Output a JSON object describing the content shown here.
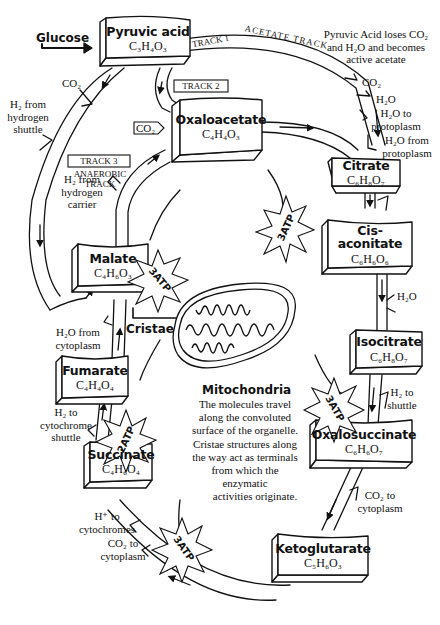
{
  "diagram": {
    "input": {
      "label": "Glucose"
    },
    "compounds": [
      {
        "id": "pyruvic-acid",
        "name": "Pyruvic acid",
        "formula": "C₃H₄O₃"
      },
      {
        "id": "oxaloacetate",
        "name": "Oxaloacetate",
        "formula": "C₄H₄O₃"
      },
      {
        "id": "citrate",
        "name": "Citrate",
        "formula": "C₆H₈O₇"
      },
      {
        "id": "cis-aconitate",
        "name": "Cis-aconitate",
        "formula": "C₆H₆O₆"
      },
      {
        "id": "isocitrate",
        "name": "Isocitrate",
        "formula": "C₆H₈O₇"
      },
      {
        "id": "oxalosuccinate",
        "name": "Oxalosuccinate",
        "formula": "C₆H₆O₇"
      },
      {
        "id": "ketoglutarate",
        "name": "Ketoglutarate",
        "formula": "C₅H₆O₃"
      },
      {
        "id": "succinate",
        "name": "Succinate",
        "formula": "C₄H₆O₄"
      },
      {
        "id": "fumarate",
        "name": "Fumarate",
        "formula": "C₄H₄O₄"
      },
      {
        "id": "malate",
        "name": "Malate",
        "formula": "C₄H₆O₃"
      }
    ],
    "tracks": {
      "track1": "TRACK 1",
      "track1_name": "ACETATE TRACK",
      "track2": "TRACK 2",
      "track3": "TRACK 3",
      "track3_name": "ANAEROBIC TRACK"
    },
    "annotations": {
      "pyruvic_note_1": "Pyruvic Acid loses CO₂",
      "pyruvic_note_2": "and H₂O and becomes",
      "pyruvic_note_3": "active acetate",
      "co2_top": "CO₂",
      "h2o_top": "H₂O",
      "h2o_to_proto_1": "H₂O to",
      "h2o_to_proto_2": "protoplasm",
      "h2o_from_proto_1": "H₂O from",
      "h2o_from_proto_2": "protoplasm",
      "co2_left": "CO₂",
      "h2_shuttle_1": "H₂ from",
      "h2_shuttle_2": "hydrogen",
      "h2_shuttle_3": "shuttle",
      "co2_box": "CO₂",
      "h2_carrier_1": "H₂ from",
      "h2_carrier_2": "hydrogen",
      "h2_carrier_3": "carrier",
      "h2o_cis": "H₂O",
      "h2_to_shuttle_1": "H₂ to",
      "h2_to_shuttle_2": "shuttle",
      "co2_cyto_right_1": "CO₂ to",
      "co2_cyto_right_2": "cytoplasm",
      "h2o_from_cyto_1": "H₂O from",
      "h2o_from_cyto_2": "cytoplasm",
      "h2_cyto_1": "H₂ to",
      "h2_cyto_2": "cytochrome",
      "h2_cyto_3": "shuttle",
      "hplus_1": "H⁺ to",
      "hplus_2": "cytochromes",
      "co2_cyto_left_1": "CO₂ to",
      "co2_cyto_left_2": "cytoplasm"
    },
    "atp_bursts": [
      {
        "label": "3ATP"
      },
      {
        "label": "3ATP"
      },
      {
        "label": "2ATP"
      },
      {
        "label": "3ATP"
      },
      {
        "label": "3ATP"
      }
    ],
    "mitochondria": {
      "cristae_label": "Cristae",
      "title": "Mitochondria",
      "desc_1": "The molecules travel",
      "desc_2": "along the convoluted",
      "desc_3": "surface of the organelle.",
      "desc_4": "Cristae structures along",
      "desc_5": "the way act as terminals",
      "desc_6": "from which the",
      "desc_7": "enzymatic",
      "desc_8": "activities originate."
    }
  }
}
